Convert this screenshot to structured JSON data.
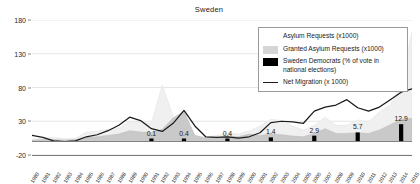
{
  "chart_data": {
    "type": "area",
    "title": "Sweden",
    "xlabel": "",
    "ylabel": "",
    "ylim": [
      -20,
      180
    ],
    "yticks": [
      180,
      130,
      80,
      30,
      -20
    ],
    "grid": true,
    "legend_position": "top-right",
    "x": [
      1980,
      1981,
      1982,
      1983,
      1984,
      1985,
      1986,
      1987,
      1988,
      1989,
      1990,
      1991,
      1992,
      1993,
      1994,
      1995,
      1996,
      1997,
      1998,
      1999,
      2000,
      2001,
      2002,
      2003,
      2004,
      2005,
      2006,
      2007,
      2008,
      2009,
      2010,
      2011,
      2012,
      2013,
      2014,
      2015
    ],
    "categories": [
      "1980",
      "1981",
      "1982",
      "1983",
      "1984",
      "1985",
      "1986",
      "1987",
      "1988",
      "1989",
      "1990",
      "1991",
      "1992",
      "1993",
      "1994",
      "1995",
      "1996",
      "1997",
      "1998",
      "1999",
      "2000",
      "2001",
      "2002",
      "2003",
      "2004",
      "2005",
      "2006",
      "2007",
      "2008",
      "2009",
      "2010",
      "2011",
      "2012",
      "2013",
      "2014",
      "2015"
    ],
    "series": [
      {
        "name": "Asylum Requests (x1000)",
        "type": "area",
        "color": "#f0f0f0",
        "values": [
          3,
          5,
          6,
          4,
          5,
          14,
          15,
          18,
          20,
          30,
          29,
          27,
          84,
          37,
          19,
          9,
          6,
          9,
          13,
          11,
          16,
          23,
          33,
          31,
          23,
          17,
          24,
          36,
          24,
          24,
          32,
          29,
          44,
          54,
          81,
          163
        ]
      },
      {
        "name": "Granted Asylum Requests (x1000)",
        "type": "area",
        "color": "#c9c9c9",
        "values": [
          2,
          3,
          3,
          2,
          3,
          6,
          7,
          9,
          11,
          16,
          14,
          13,
          18,
          35,
          45,
          9,
          5,
          5,
          8,
          7,
          11,
          9,
          11,
          10,
          8,
          7,
          12,
          19,
          12,
          12,
          13,
          12,
          17,
          25,
          33,
          34
        ]
      },
      {
        "name": "Net Migration (x 1000)",
        "type": "line",
        "color": "#1a1a1a",
        "values": [
          9,
          6,
          1,
          0,
          1,
          7,
          10,
          16,
          24,
          36,
          31,
          19,
          15,
          27,
          46,
          23,
          7,
          6,
          7,
          5,
          7,
          13,
          28,
          30,
          29,
          27,
          45,
          51,
          54,
          62,
          50,
          45,
          51,
          62,
          73,
          78
        ]
      }
    ],
    "bar_series": {
      "name": "Sweden Democrats (% of vote in national elections)",
      "color": "#000000",
      "points": [
        {
          "year": "1991",
          "label": "0.1",
          "value": 0.1
        },
        {
          "year": "1994",
          "label": "0.4",
          "value": 0.4
        },
        {
          "year": "1998",
          "label": "0.4",
          "value": 0.4
        },
        {
          "year": "2002",
          "label": "1.4",
          "value": 1.4
        },
        {
          "year": "2006",
          "label": "2.9",
          "value": 2.9
        },
        {
          "year": "2010",
          "label": "5.7",
          "value": 5.7
        },
        {
          "year": "2014",
          "label": "12.9",
          "value": 12.9
        }
      ]
    },
    "legend_entries": [
      {
        "label": "Asylum Requests (x1000)",
        "swatch": "asylum"
      },
      {
        "label": "Granted Asylum Requests (x1000)",
        "swatch": "granted"
      },
      {
        "label": "Sweden Democrats (% of vote in national elections)",
        "swatch": "sd"
      },
      {
        "label": "Net Migration (x 1000)",
        "swatch": "line"
      }
    ]
  }
}
